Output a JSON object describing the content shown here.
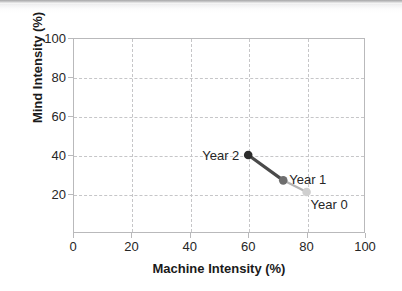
{
  "chart_data": {
    "type": "line",
    "title": "",
    "subtitle": "",
    "xlabel": "Machine Intensity (%)",
    "ylabel": "Mind Intensity (%)",
    "xlim": [
      0,
      100
    ],
    "ylim": [
      0,
      100
    ],
    "xticks": [
      0,
      20,
      40,
      60,
      80,
      100
    ],
    "yticks": [
      0,
      20,
      40,
      60,
      80,
      100
    ],
    "xtick_labels": [
      "0",
      "20",
      "40",
      "60",
      "80",
      "100"
    ],
    "ytick_labels": [
      "",
      "20",
      "40",
      "60",
      "80",
      "100"
    ],
    "grid": true,
    "grid_style": "dashed",
    "grid_color": "#c6c6c8",
    "legend": "none",
    "series": [
      {
        "name": "Trajectory",
        "points": [
          {
            "label": "Year 0",
            "x": 80,
            "y": 21,
            "marker_color": "#cfcfcf",
            "label_position": "below-right"
          },
          {
            "label": "Year 1",
            "x": 72,
            "y": 27,
            "marker_color": "#6e6e6e",
            "label_position": "right"
          },
          {
            "label": "Year 2",
            "x": 60,
            "y": 40,
            "marker_color": "#2b2b2b",
            "label_position": "left"
          }
        ],
        "segments": [
          {
            "from": "Year 0",
            "to": "Year 1",
            "color": "#b4b4b4",
            "width": 2.2
          },
          {
            "from": "Year 1",
            "to": "Year 2",
            "color": "#4a4a4a",
            "width": 3.2
          }
        ]
      }
    ]
  },
  "colors": {
    "axis": "#b9b9bb",
    "grid": "#c6c6c8",
    "text": "#262626",
    "title_text": "#1a1a1a",
    "background": "#ffffff",
    "year0_marker": "#cfcfcf",
    "year1_marker": "#6e6e6e",
    "year2_marker": "#2b2b2b"
  }
}
